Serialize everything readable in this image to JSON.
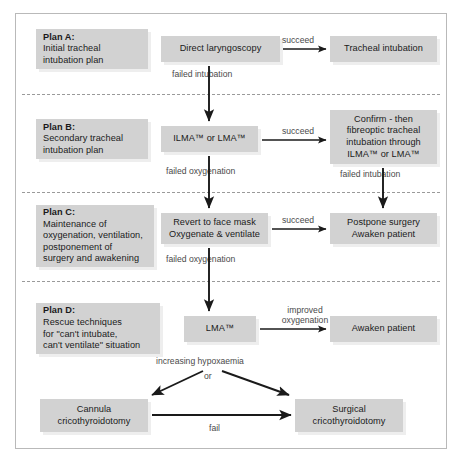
{
  "diagram": {
    "colors": {
      "box_fill": "#d2d2d2",
      "box_shadow": "#eeeeee",
      "frame_border": "#b9b9b9",
      "separator": "#9a9a9a",
      "arrow": "#1a1a1a",
      "label_text": "#4a4a4a",
      "box_text": "#1a1a1a",
      "background": "#ffffff"
    },
    "plans": [
      {
        "id": "plan-a",
        "title": "Plan A:",
        "lines": [
          "Initial tracheal",
          "intubation plan"
        ]
      },
      {
        "id": "plan-b",
        "title": "Plan B:",
        "lines": [
          "Secondary tracheal",
          "intubation plan"
        ]
      },
      {
        "id": "plan-c",
        "title": "Plan C:",
        "lines": [
          "Maintenance of",
          "oxygenation, ventilation,",
          "postponement of",
          "surgery and awakening"
        ]
      },
      {
        "id": "plan-d",
        "title": "Plan D:",
        "lines": [
          "Rescue techniques",
          "for \"can't intubate,",
          "can't ventilate\" situation"
        ]
      }
    ],
    "nodes": {
      "direct_laryngoscopy": [
        "Direct laryngoscopy"
      ],
      "tracheal_intubation": [
        "Tracheal intubation"
      ],
      "ilma_or_lma": [
        "ILMA™ or LMA™"
      ],
      "confirm_fibreoptic": [
        "Confirm - then",
        "fibreoptic tracheal",
        "intubation through",
        "ILMA™ or LMA™"
      ],
      "revert_face_mask": [
        "Revert to face mask",
        "Oxygenate & ventilate"
      ],
      "postpone_surgery": [
        "Postpone surgery",
        "Awaken patient"
      ],
      "lma": [
        "LMA™"
      ],
      "awaken_patient": [
        "Awaken patient"
      ],
      "cannula_cric": [
        "Cannula",
        "cricothyroidotomy"
      ],
      "surgical_cric": [
        "Surgical",
        "cricothyroidotomy"
      ]
    },
    "edge_labels": {
      "succeed_a": "succeed",
      "failed_intubation_a": "failed intubation",
      "succeed_b": "succeed",
      "failed_oxygenation_b": "failed oxygenation",
      "failed_intubation_b": "failed intubation",
      "succeed_c": "succeed",
      "failed_oxygenation_c": "failed oxygenation",
      "improved_oxygenation_line1": "improved",
      "improved_oxygenation_line2": "oxygenation",
      "increasing_hypoxaemia": "increasing hypoxaemia",
      "or": "or",
      "fail": "fail"
    }
  }
}
